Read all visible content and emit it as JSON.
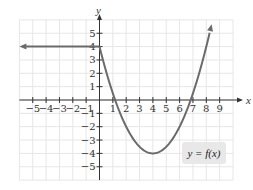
{
  "chart_data": {
    "type": "line",
    "title": "",
    "xlabel": "x",
    "ylabel": "y",
    "xlim": [
      -6,
      10
    ],
    "ylim": [
      -6,
      6
    ],
    "grid": true,
    "x_ticks": [
      -5,
      -4,
      -3,
      -2,
      -1,
      1,
      2,
      3,
      4,
      5,
      6,
      7,
      8,
      9
    ],
    "y_ticks": [
      -5,
      -4,
      -3,
      -2,
      -1,
      1,
      2,
      3,
      4,
      5
    ],
    "x_tick_labels": [
      "−5",
      "−4",
      "−3",
      "−2",
      "−1",
      "1",
      "2",
      "3",
      "4",
      "5",
      "6",
      "7",
      "8",
      "9"
    ],
    "y_tick_labels": [
      "−5",
      "−4",
      "−3",
      "−2",
      "−1",
      "1",
      "2",
      "3",
      "4",
      "5"
    ],
    "series": [
      {
        "name": "y = f(x)",
        "segments": [
          {
            "kind": "constant",
            "x": [
              -6,
              0
            ],
            "y": 4,
            "arrow_left": true
          },
          {
            "kind": "parabola",
            "vertex": [
              4,
              -4
            ],
            "passes": [
              [
                0,
                4
              ],
              [
                8,
                4
              ]
            ],
            "x_range": [
              0,
              8.4
            ],
            "arrow_right": true
          }
        ]
      }
    ],
    "annotations": [
      {
        "text": "y = f(x)",
        "position": [
          7.5,
          -4.2
        ]
      }
    ]
  },
  "axes": {
    "x_name": "x",
    "y_name": "y"
  },
  "legend": {
    "label": "y = f(x)"
  },
  "colors": {
    "curve": "#6b6b6b",
    "grid": "#e6e6e6",
    "axis": "#333333",
    "label_box": "#e8e8e8"
  }
}
